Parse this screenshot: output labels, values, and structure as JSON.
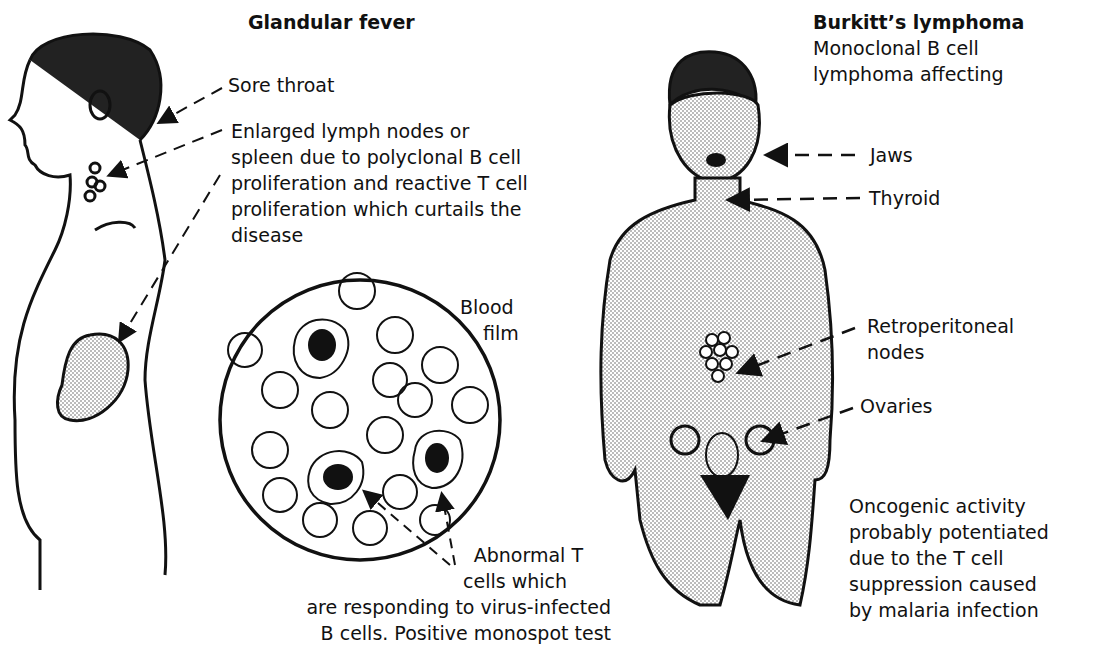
{
  "glandular_fever": {
    "title": "Glandular fever",
    "labels": {
      "sore_throat": "Sore throat",
      "lymph_nodes": [
        "Enlarged lymph nodes or",
        "spleen due to polyclonal B cell",
        "proliferation and reactive T cell",
        "proliferation which curtails the",
        "disease"
      ],
      "blood_film": [
        "Blood",
        "film"
      ],
      "abnormal_t_cells": [
        "Abnormal T",
        "cells which",
        "are responding to virus-infected",
        "B cells. Positive monospot test"
      ]
    }
  },
  "burkitts_lymphoma": {
    "title": "Burkitt’s lymphoma",
    "subtitle": [
      "Monoclonal B cell",
      "lymphoma affecting"
    ],
    "labels": {
      "jaws": "Jaws",
      "thyroid": "Thyroid",
      "retroperitoneal": [
        "Retroperitoneal",
        "nodes"
      ],
      "ovaries": "Ovaries",
      "oncogenic": [
        "Oncogenic activity",
        "probably potentiated",
        "due to the T cell",
        "suppression caused",
        "by malaria infection"
      ]
    }
  }
}
